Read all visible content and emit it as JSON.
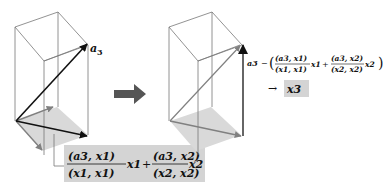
{
  "diagram": {
    "colors": {
      "box_edge": "#777777",
      "shadow": "#d9d9d9",
      "arrow_dark": "#111111",
      "arrow_gray": "#808080",
      "label_bg": "#d4d4d4",
      "transition_arrow": "#555555"
    },
    "left_panel": {
      "vector_label": "a3",
      "vector_label_main": "a",
      "vector_label_sub": "3",
      "projection_label": {
        "term1": {
          "num": "(a3, x1)",
          "den": "(x1, x1)",
          "vec": "x1"
        },
        "plus": "+",
        "term2": {
          "num": "(a3, x2)",
          "den": "(x2, x2)",
          "vec": "x2"
        }
      }
    },
    "transition_arrow": "right-arrow",
    "right_panel": {
      "formula": {
        "lhs": "a3",
        "minus": "−",
        "lparen": "(",
        "term1": {
          "num": "(a3, x1)",
          "den": "(x1, x1)",
          "vec": "x1"
        },
        "plus": "+",
        "term2": {
          "num": "(a3, x2)",
          "den": "(x2, x2)",
          "vec": "x2"
        },
        "rparen": ")"
      },
      "result_arrow": "→",
      "result": "x3"
    }
  }
}
